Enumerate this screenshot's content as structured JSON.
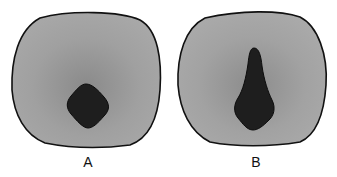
{
  "figure": {
    "panels": [
      {
        "id": "A",
        "label": "A",
        "inner_shape": "diamond",
        "fill_color": "#9a9a9a",
        "inner_color": "#1e1e1e",
        "outline_color": "#111111"
      },
      {
        "id": "B",
        "label": "B",
        "inner_shape": "elongated-teardrop",
        "fill_color": "#9c9c9c",
        "inner_color": "#1e1e1e",
        "outline_color": "#111111"
      }
    ]
  }
}
